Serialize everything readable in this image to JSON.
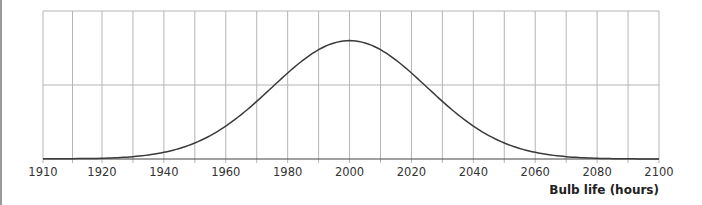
{
  "chart_data": {
    "type": "line",
    "title": "",
    "xlabel": "Bulb life (hours)",
    "ylabel": "",
    "x_tick_labels": [
      "1910",
      "1920",
      "1940",
      "1960",
      "1980",
      "2000",
      "2020",
      "2040",
      "2060",
      "2080",
      "2100"
    ],
    "x_gridlines": [
      1910,
      1915,
      1920,
      1930,
      1940,
      1950,
      1960,
      1970,
      1980,
      1990,
      2000,
      2010,
      2020,
      2030,
      2040,
      2050,
      2060,
      2070,
      2080,
      2090,
      2100
    ],
    "xlim": [
      1910,
      2100
    ],
    "ylim": [
      0,
      1
    ],
    "y_gridlines": [
      0,
      0.5,
      1
    ],
    "grid": true,
    "legend": null,
    "distribution": "normal",
    "mean": 2000,
    "std_dev": 25,
    "series": [
      {
        "name": "Bulb life distribution",
        "x": [
          1910,
          1920,
          1930,
          1940,
          1950,
          1960,
          1970,
          1980,
          1990,
          2000,
          2010,
          2020,
          2030,
          2040,
          2050,
          2060,
          2070,
          2080,
          2090,
          2100
        ],
        "values": [
          0.0012,
          0.0048,
          0.016,
          0.045,
          0.108,
          0.222,
          0.389,
          0.581,
          0.739,
          0.8,
          0.739,
          0.581,
          0.389,
          0.222,
          0.108,
          0.045,
          0.016,
          0.0048,
          0.0012,
          0.0003
        ]
      }
    ]
  }
}
